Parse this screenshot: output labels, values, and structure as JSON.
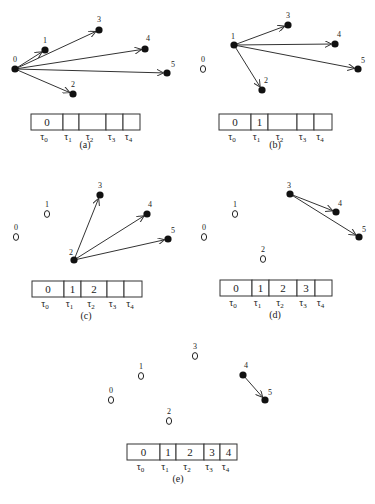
{
  "figure": {
    "panels": [
      {
        "id": "a",
        "caption": "(a)",
        "caption_pos": [
          85,
          148
        ],
        "nodes": [
          {
            "label": "0",
            "x": 15,
            "y": 69,
            "state": "filled",
            "lx": -2,
            "ly": -7
          },
          {
            "label": "1",
            "x": 45,
            "y": 50,
            "state": "filled",
            "lx": -2,
            "ly": -7
          },
          {
            "label": "2",
            "x": 73,
            "y": 94,
            "state": "filled",
            "lx": -2,
            "ly": -7
          },
          {
            "label": "3",
            "x": 99,
            "y": 30,
            "state": "filled",
            "lx": -2,
            "ly": -8
          },
          {
            "label": "4",
            "x": 145,
            "y": 49,
            "state": "filled",
            "lx": 1,
            "ly": -8
          },
          {
            "label": "5",
            "x": 167,
            "y": 73,
            "state": "filled",
            "lx": 4,
            "ly": -6
          }
        ],
        "edges": [
          [
            0,
            1
          ],
          [
            0,
            2
          ],
          [
            0,
            3
          ],
          [
            0,
            4
          ],
          [
            0,
            5
          ]
        ],
        "table": {
          "x": 31,
          "y": 114,
          "h": 16,
          "dividers": [
            31,
            63,
            79,
            106,
            123,
            140
          ],
          "cells": [
            "0",
            "",
            "",
            "",
            ""
          ],
          "taus": [
            "τ0",
            "τ1",
            "τ2",
            "τ3",
            "τ4"
          ]
        }
      },
      {
        "id": "b",
        "caption": "(b)",
        "caption_pos": [
          275,
          148
        ],
        "nodes": [
          {
            "label": "0",
            "x": 203,
            "y": 69,
            "state": "open",
            "lx": -2,
            "ly": -7
          },
          {
            "label": "1",
            "x": 234,
            "y": 45,
            "state": "filled",
            "lx": -3,
            "ly": -6
          },
          {
            "label": "2",
            "x": 262,
            "y": 90,
            "state": "filled",
            "lx": 2,
            "ly": -7
          },
          {
            "label": "3",
            "x": 288,
            "y": 25,
            "state": "filled",
            "lx": -2,
            "ly": -7
          },
          {
            "label": "4",
            "x": 335,
            "y": 44,
            "state": "filled",
            "lx": 2,
            "ly": -7
          },
          {
            "label": "5",
            "x": 358,
            "y": 69,
            "state": "filled",
            "lx": 3,
            "ly": -6
          }
        ],
        "edges": [
          [
            1,
            2
          ],
          [
            1,
            3
          ],
          [
            1,
            4
          ],
          [
            1,
            5
          ]
        ],
        "table": {
          "x": 219,
          "y": 114,
          "h": 16,
          "dividers": [
            219,
            251,
            268,
            297,
            314,
            332
          ],
          "cells": [
            "0",
            "1",
            "",
            "",
            ""
          ],
          "taus": [
            "τ0",
            "τ1",
            "τ2",
            "τ3",
            "τ4"
          ]
        }
      },
      {
        "id": "c",
        "caption": "(c)",
        "caption_pos": [
          86,
          319
        ],
        "nodes": [
          {
            "label": "0",
            "x": 16,
            "y": 237,
            "state": "open",
            "lx": -2,
            "ly": -7
          },
          {
            "label": "1",
            "x": 47,
            "y": 214,
            "state": "open",
            "lx": -2,
            "ly": -7
          },
          {
            "label": "2",
            "x": 74,
            "y": 260,
            "state": "filled",
            "lx": -5,
            "ly": -5
          },
          {
            "label": "3",
            "x": 100,
            "y": 195,
            "state": "filled",
            "lx": -2,
            "ly": -7
          },
          {
            "label": "4",
            "x": 147,
            "y": 214,
            "state": "filled",
            "lx": 1,
            "ly": -7
          },
          {
            "label": "5",
            "x": 168,
            "y": 239,
            "state": "filled",
            "lx": 3,
            "ly": -6
          }
        ],
        "edges": [
          [
            2,
            3
          ],
          [
            2,
            4
          ],
          [
            2,
            5
          ]
        ],
        "table": {
          "x": 32,
          "y": 281,
          "h": 16,
          "dividers": [
            32,
            64,
            81,
            107,
            124,
            142
          ],
          "cells": [
            "0",
            "1",
            "2",
            "",
            ""
          ],
          "taus": [
            "τ0",
            "τ1",
            "τ2",
            "τ3",
            "τ4"
          ]
        }
      },
      {
        "id": "d",
        "caption": "(d)",
        "caption_pos": [
          275,
          318
        ],
        "nodes": [
          {
            "label": "0",
            "x": 204,
            "y": 237,
            "state": "open",
            "lx": -2,
            "ly": -7
          },
          {
            "label": "1",
            "x": 235,
            "y": 214,
            "state": "open",
            "lx": -2,
            "ly": -7
          },
          {
            "label": "2",
            "x": 263,
            "y": 259,
            "state": "open",
            "lx": -2,
            "ly": -7
          },
          {
            "label": "3",
            "x": 290,
            "y": 194,
            "state": "filled",
            "lx": -3,
            "ly": -6
          },
          {
            "label": "4",
            "x": 336,
            "y": 212,
            "state": "filled",
            "lx": 2,
            "ly": -6
          },
          {
            "label": "5",
            "x": 359,
            "y": 237,
            "state": "filled",
            "lx": 3,
            "ly": -5
          }
        ],
        "edges": [
          [
            3,
            4
          ],
          [
            3,
            5
          ]
        ],
        "table": {
          "x": 220,
          "y": 280,
          "h": 16,
          "dividers": [
            220,
            252,
            269,
            297,
            315,
            332
          ],
          "cells": [
            "0",
            "1",
            "2",
            "3",
            ""
          ],
          "taus": [
            "τ0",
            "τ1",
            "τ2",
            "τ3",
            "τ4"
          ]
        }
      },
      {
        "id": "e",
        "caption": "(e)",
        "caption_pos": [
          178,
          482
        ],
        "nodes": [
          {
            "label": "0",
            "x": 111,
            "y": 400,
            "state": "open",
            "lx": -2,
            "ly": -7
          },
          {
            "label": "1",
            "x": 141,
            "y": 376,
            "state": "open",
            "lx": -2,
            "ly": -7
          },
          {
            "label": "2",
            "x": 169,
            "y": 421,
            "state": "open",
            "lx": -2,
            "ly": -7
          },
          {
            "label": "3",
            "x": 195,
            "y": 356,
            "state": "open",
            "lx": -2,
            "ly": -7
          },
          {
            "label": "4",
            "x": 243,
            "y": 375,
            "state": "filled",
            "lx": 1,
            "ly": -7
          },
          {
            "label": "5",
            "x": 265,
            "y": 400,
            "state": "filled",
            "lx": 3,
            "ly": -5
          }
        ],
        "edges": [
          [
            4,
            5
          ]
        ],
        "table": {
          "x": 127,
          "y": 444,
          "h": 16,
          "dividers": [
            127,
            160,
            176,
            204,
            220,
            237
          ],
          "cells": [
            "0",
            "1",
            "2",
            "3",
            "4"
          ],
          "taus": [
            "τ0",
            "τ1",
            "τ2",
            "τ3",
            "τ4"
          ]
        }
      }
    ]
  }
}
